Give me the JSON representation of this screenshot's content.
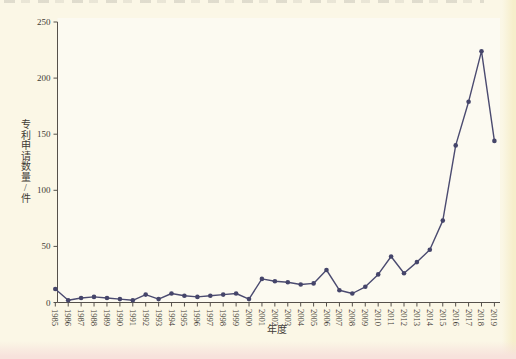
{
  "page": {
    "background": "#fbf7e6",
    "right_edge_tint": "#f6eecb",
    "bottom_edge_tint": "#f7e2dc"
  },
  "chart_data": {
    "type": "line",
    "title": "",
    "xlabel": "年度",
    "ylabel": "专利申请数量/件",
    "categories": [
      "1985",
      "1986",
      "1987",
      "1988",
      "1989",
      "1990",
      "1991",
      "1992",
      "1993",
      "1994",
      "1995",
      "1996",
      "1997",
      "1998",
      "1999",
      "2000",
      "2001",
      "2002",
      "2003",
      "2004",
      "2005",
      "2006",
      "2007",
      "2008",
      "2009",
      "2010",
      "2011",
      "2012",
      "2013",
      "2014",
      "2015",
      "2016",
      "2017",
      "2018",
      "2019"
    ],
    "values": [
      12,
      2,
      4,
      5,
      4,
      3,
      2,
      7,
      3,
      8,
      6,
      5,
      6,
      7,
      8,
      3,
      21,
      19,
      18,
      16,
      17,
      29,
      11,
      8,
      14,
      25,
      41,
      26,
      36,
      47,
      73,
      140,
      179,
      224,
      144
    ],
    "ylim": [
      0,
      250
    ],
    "yticks": [
      0,
      50,
      100,
      150,
      200,
      250
    ],
    "grid": false,
    "legend": "none",
    "line_color": "#4b4b70",
    "marker_color": "#45456a",
    "axis_color": "#56514b",
    "plot_background": "#fcfaf1"
  }
}
